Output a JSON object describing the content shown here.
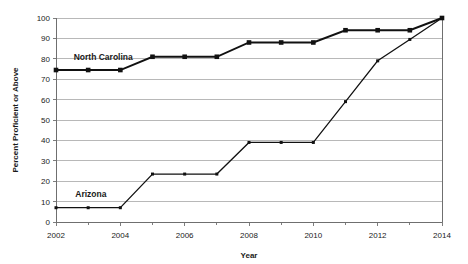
{
  "chart_data": {
    "type": "line",
    "title": "",
    "xlabel": "Year",
    "ylabel": "Percent Proficient or Above",
    "x": [
      2002,
      2003,
      2004,
      2005,
      2006,
      2007,
      2008,
      2009,
      2010,
      2011,
      2012,
      2013,
      2014
    ],
    "xlim": [
      2002,
      2014
    ],
    "ylim": [
      0,
      100
    ],
    "xticks": [
      2002,
      2004,
      2006,
      2008,
      2010,
      2012,
      2014
    ],
    "xticklabels": [
      "2002",
      "2004",
      "2006",
      "2008",
      "2010",
      "2012",
      "2014"
    ],
    "yticks": [
      0,
      10,
      20,
      30,
      40,
      50,
      60,
      70,
      80,
      90,
      100
    ],
    "yticklabels": [
      "0",
      "10",
      "20",
      "30",
      "40",
      "50",
      "60",
      "70",
      "80",
      "90",
      "100"
    ],
    "grid": "horizontal",
    "legend": "inline-labels",
    "series": [
      {
        "name": "North Carolina",
        "color": "#111111",
        "marker": "square",
        "label_x": 2002.55,
        "label_y": 79.5,
        "values": [
          74.5,
          74.5,
          74.5,
          81,
          81,
          81,
          88,
          88,
          88,
          94,
          94,
          94,
          100
        ]
      },
      {
        "name": "Arizona",
        "color": "#111111",
        "marker": "square",
        "label_x": 2002.6,
        "label_y": 12.5,
        "values": [
          7,
          7,
          7,
          23.5,
          23.5,
          23.5,
          39,
          39,
          39,
          59,
          79,
          89.5,
          100
        ]
      }
    ]
  }
}
